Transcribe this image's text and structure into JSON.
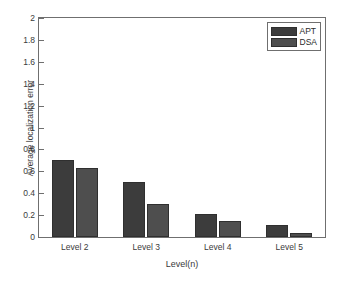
{
  "chart_data": {
    "type": "bar",
    "title": "",
    "xlabel": "Level(n)",
    "ylabel": "Average localization error",
    "categories": [
      "Level 2",
      "Level 3",
      "Level 4",
      "Level 5"
    ],
    "series": [
      {
        "name": "APT",
        "color": "#3c3c3c",
        "values": [
          0.7,
          0.5,
          0.21,
          0.11
        ]
      },
      {
        "name": "DSA",
        "color": "#4e4e4e",
        "values": [
          0.63,
          0.3,
          0.15,
          0.04
        ]
      }
    ],
    "ylim": [
      0,
      2
    ],
    "yticks": [
      0,
      0.2,
      0.4,
      0.6,
      0.8,
      1,
      1.2,
      1.4,
      1.6,
      1.8,
      2
    ],
    "ytick_labels": [
      "0",
      "0.2",
      "0.4",
      "0.6",
      "0.8",
      "1",
      "1.2",
      "1.4",
      "1.6",
      "1.8",
      "2"
    ],
    "grid": false,
    "legend_position": "top-right",
    "legend_entries": [
      "APT",
      "DSA"
    ],
    "axes_color": "#6f6f6f",
    "background_color": "#ffffff"
  }
}
